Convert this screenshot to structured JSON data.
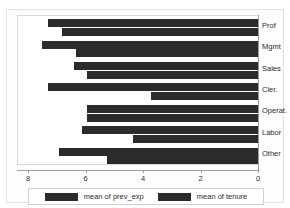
{
  "top_fragment": "",
  "chart_data": {
    "type": "bar",
    "orientation": "horizontal",
    "title": "",
    "xlabel": "",
    "ylabel": "",
    "xlim": [
      8,
      0
    ],
    "x_reversed": true,
    "grid": false,
    "legend_position": "bottom",
    "categories": [
      "Prof",
      "Mgmt",
      "Sales",
      "Cler.",
      "Operat.",
      "Labor",
      "Other"
    ],
    "xticks": [
      8,
      6,
      4,
      2,
      0
    ],
    "xtick_labels": [
      "8",
      "6",
      "4",
      "2",
      "0"
    ],
    "series": [
      {
        "name": "mean of prev_exp",
        "color": "#2b2b2b",
        "values": [
          7.35,
          7.55,
          6.45,
          7.35,
          6.0,
          6.15,
          6.95
        ]
      },
      {
        "name": "mean of tenure",
        "color": "#2b2b2b",
        "values": [
          6.85,
          6.35,
          6.0,
          3.75,
          6.0,
          4.4,
          5.3
        ]
      }
    ]
  },
  "legend": {
    "items": [
      {
        "label": "mean of prev_exp",
        "color": "#2b2b2b"
      },
      {
        "label": "mean of tenure",
        "color": "#2b2b2b"
      }
    ]
  },
  "colors": {
    "bar": "#2b2b2b",
    "axis": "#9e9e9e",
    "plot_background": "#ffffff",
    "figure_background": "#fdfdfd",
    "text": "#2d2d2d"
  }
}
